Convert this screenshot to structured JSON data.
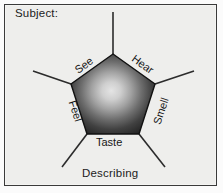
{
  "figure": {
    "width": 223,
    "height": 193,
    "background_color": "#eeeeec",
    "border_color": "#3a3a3a"
  },
  "header": {
    "subject_label": "Subject:"
  },
  "footer": {
    "describing_label": "Describing"
  },
  "diagram": {
    "shape": "pentagon",
    "center_x": 113,
    "center_y": 98,
    "radius": 44,
    "fill_center_color": "#dcdcdc",
    "fill_edge_color": "#272727",
    "outline_color": "#111111",
    "spoke_color": "#2b2b2b",
    "edge_labels": [
      {
        "id": "see",
        "label": "See",
        "rotation": -36
      },
      {
        "id": "hear",
        "label": "Hear",
        "rotation": 36
      },
      {
        "id": "smell",
        "label": "Smell",
        "rotation": -72
      },
      {
        "id": "feel",
        "label": "Feel",
        "rotation": 72
      },
      {
        "id": "taste",
        "label": "Taste",
        "rotation": 0
      }
    ]
  }
}
